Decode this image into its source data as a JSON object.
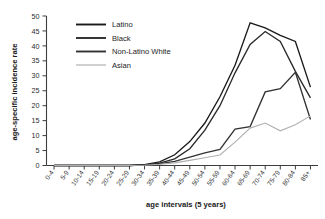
{
  "chart_data": {
    "type": "line",
    "title": "",
    "xlabel": "age intervals (5 years)",
    "ylabel": "age-specific incidence rate",
    "ylim": [
      0,
      50
    ],
    "yticks": [
      0,
      5,
      10,
      15,
      20,
      25,
      30,
      35,
      40,
      45,
      50
    ],
    "grid": false,
    "legend_position": "top-left-inside",
    "categories": [
      "0-4",
      "5-9",
      "10-14",
      "15-19",
      "20-24",
      "25-29",
      "30-34",
      "35-39",
      "40-44",
      "45-49",
      "50-54",
      "55-59",
      "60-64",
      "65-69",
      "70-74",
      "75-79",
      "80-84",
      "85+"
    ],
    "series": [
      {
        "name": "Latino",
        "color": "#1a1a1a",
        "values": [
          0,
          0,
          0,
          0,
          0,
          0,
          0.3,
          1.2,
          3.6,
          8.0,
          14.2,
          23.0,
          33.5,
          47.7,
          46.0,
          43.5,
          41.5,
          26.2
        ]
      },
      {
        "name": "Black",
        "color": "#2b2b2b",
        "values": [
          0,
          0,
          0,
          0,
          0,
          0,
          0.2,
          0.8,
          2.2,
          5.6,
          11.8,
          20.0,
          31.0,
          40.5,
          44.8,
          41.5,
          31.5,
          22.6
        ]
      },
      {
        "name": "Non-Latino White",
        "color": "#333333",
        "values": [
          0,
          0,
          0,
          0,
          0,
          0,
          0.2,
          0.6,
          1.4,
          2.8,
          4.2,
          5.4,
          12.2,
          13.0,
          24.6,
          25.7,
          31.2,
          15.4
        ]
      },
      {
        "name": "Asian",
        "color": "#b0b0b0",
        "values": [
          0,
          0,
          0,
          0,
          0,
          0,
          0.1,
          0.4,
          0.9,
          1.7,
          2.6,
          3.5,
          7.8,
          12.5,
          14.2,
          11.6,
          13.6,
          16.6
        ]
      }
    ]
  }
}
